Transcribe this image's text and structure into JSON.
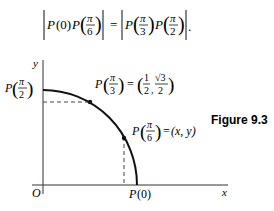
{
  "equation": {
    "lhs": "|P(0)P(π/6)|",
    "rhs": "|P(π/3)P(π/2)|",
    "P": "P",
    "zero": "(0)",
    "pi": "π",
    "d6": "6",
    "d3": "3",
    "d2": "2",
    "equals": "=",
    "period": "."
  },
  "figure": {
    "caption": "Figure 9.3",
    "axes": {
      "x_label": "x",
      "y_label": "y",
      "origin_label": "O"
    },
    "points": [
      {
        "id": "P0",
        "label": "P(0)"
      },
      {
        "id": "P_pi_6",
        "label": "P(π/6) = (x, y)",
        "coords": "(x, y)"
      },
      {
        "id": "P_pi_3",
        "label": "P(π/3) = (1/2, √3/2)",
        "num1": "1",
        "den1": "2",
        "num2": "√3",
        "den2": "2"
      },
      {
        "id": "P_pi_2",
        "label": "P(π/2)"
      }
    ]
  }
}
